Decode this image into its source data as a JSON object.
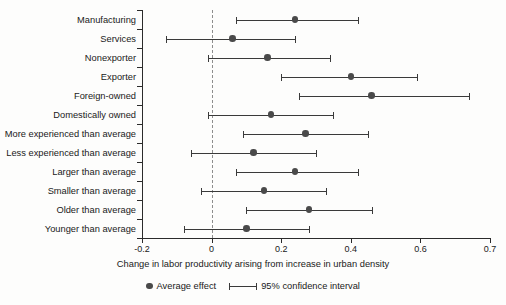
{
  "chart_data": {
    "type": "bar",
    "subtype": "forest-plot",
    "title": "",
    "xlabel": "Change in labor productivity arising from increase in urban density",
    "ylabel": "",
    "xlim": [
      -0.2,
      0.7
    ],
    "grid": false,
    "zero_reference_line": 0,
    "legend_position": "bottom",
    "xticks": [
      -0.2,
      0,
      0.2,
      0.4,
      0.6,
      0.7
    ],
    "xtick_labels": [
      "-0.2",
      "0",
      "0.2",
      "0.4",
      "0.6",
      "0.7"
    ],
    "categories": [
      "Manufacturing",
      "Services",
      "Nonexporter",
      "Exporter",
      "Foreign-owned",
      "Domestically owned",
      "More experienced than average",
      "Less experienced than average",
      "Larger than average",
      "Smaller than average",
      "Older than average",
      "Younger than average"
    ],
    "series": [
      {
        "name": "Average effect",
        "values": [
          0.24,
          0.06,
          0.16,
          0.4,
          0.46,
          0.17,
          0.27,
          0.12,
          0.24,
          0.15,
          0.28,
          0.1
        ]
      },
      {
        "name": "95% confidence interval lower",
        "values": [
          0.07,
          -0.13,
          -0.01,
          0.2,
          0.25,
          -0.01,
          0.09,
          -0.06,
          0.07,
          -0.03,
          0.1,
          -0.08
        ]
      },
      {
        "name": "95% confidence interval upper",
        "values": [
          0.42,
          0.24,
          0.34,
          0.59,
          0.67,
          0.35,
          0.45,
          0.3,
          0.42,
          0.33,
          0.46,
          0.28
        ]
      }
    ],
    "points": [
      {
        "label": "Manufacturing",
        "effect": 0.24,
        "ci_low": 0.07,
        "ci_high": 0.42
      },
      {
        "label": "Services",
        "effect": 0.06,
        "ci_low": -0.13,
        "ci_high": 0.24
      },
      {
        "label": "Nonexporter",
        "effect": 0.16,
        "ci_low": -0.01,
        "ci_high": 0.34
      },
      {
        "label": "Exporter",
        "effect": 0.4,
        "ci_low": 0.2,
        "ci_high": 0.59
      },
      {
        "label": "Foreign-owned",
        "effect": 0.46,
        "ci_low": 0.25,
        "ci_high": 0.67
      },
      {
        "label": "Domestically owned",
        "effect": 0.17,
        "ci_low": -0.01,
        "ci_high": 0.35
      },
      {
        "label": "More experienced than average",
        "effect": 0.27,
        "ci_low": 0.09,
        "ci_high": 0.45
      },
      {
        "label": "Less experienced than average",
        "effect": 0.12,
        "ci_low": -0.06,
        "ci_high": 0.3
      },
      {
        "label": "Larger than average",
        "effect": 0.24,
        "ci_low": 0.07,
        "ci_high": 0.42
      },
      {
        "label": "Smaller than average",
        "effect": 0.15,
        "ci_low": -0.03,
        "ci_high": 0.33
      },
      {
        "label": "Older than average",
        "effect": 0.28,
        "ci_low": 0.1,
        "ci_high": 0.46
      },
      {
        "label": "Younger than average",
        "effect": 0.1,
        "ci_low": -0.08,
        "ci_high": 0.28
      }
    ],
    "legend": [
      {
        "marker": "dot",
        "label": "Average effect"
      },
      {
        "marker": "line",
        "label": "95% confidence interval"
      }
    ],
    "colors": {
      "marker": "#4a4a4a",
      "interval": "#3a3a3a",
      "axis": "#2b2b2b",
      "zero_line": "#8d8d8d",
      "background": "#fdfdfc",
      "text": "#1a1a1a"
    }
  }
}
